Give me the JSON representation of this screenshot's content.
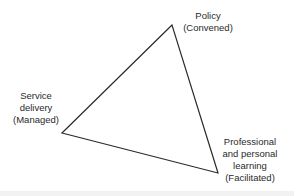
{
  "diagram": {
    "type": "triangle",
    "vertices": {
      "top": {
        "x": 172,
        "y": 25
      },
      "left": {
        "x": 62,
        "y": 133
      },
      "bottom_right": {
        "x": 218,
        "y": 173
      }
    },
    "stroke_color": "#2a2a2a",
    "labels": {
      "policy": {
        "line1": "Policy",
        "line2": "(Convened)"
      },
      "service_delivery": {
        "line1": "Service",
        "line2": "delivery",
        "line3": "(Managed)"
      },
      "professional_learning": {
        "line1": "Professional",
        "line2": "and personal",
        "line3": "learning",
        "line4": "(Facilitated)"
      }
    }
  }
}
